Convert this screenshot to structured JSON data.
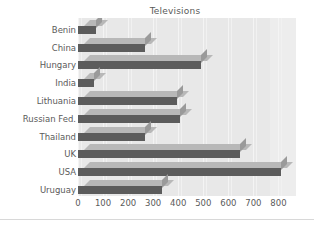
{
  "chart_data": {
    "type": "bar",
    "orientation": "horizontal",
    "title": "Televisions",
    "xlabel": "",
    "ylabel": "",
    "categories": [
      "Benin",
      "China",
      "Hungary",
      "India",
      "Lithuania",
      "Russian Fed.",
      "Thailand",
      "UK",
      "USA",
      "Uruguay"
    ],
    "values": [
      72,
      267,
      491,
      65,
      396,
      408,
      267,
      645,
      810,
      335
    ],
    "xlim": [
      0,
      870
    ],
    "xticks": [
      0,
      100,
      200,
      300,
      400,
      500,
      600,
      700,
      800
    ],
    "xtick_labels": [
      "0",
      "100",
      "200",
      "300",
      "400",
      "500",
      "600",
      "700",
      "800"
    ],
    "grid": true,
    "legend": false,
    "style": "3d-shaded-bars",
    "colors": {
      "bar_front": "#5c5c5c",
      "bar_top": "#b8b8b8",
      "bar_side": "#9a9a9a",
      "plot_background": "#e8e8e8",
      "gridline": "#f4f4f4",
      "text": "#5a5a5a",
      "page_background": "#ffffff"
    }
  }
}
